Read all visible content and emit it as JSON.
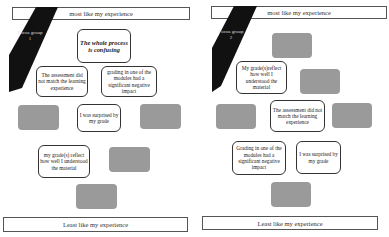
{
  "panels": [
    {
      "focus_label": "Focus group 1",
      "top_label": "most like my experience",
      "bottom_label": "Least like my experience",
      "cards": [
        {
          "text": "The whole process is confusing",
          "emphasis": true
        },
        {
          "text": "The assessment did not match the learning experience"
        },
        {
          "text": "grading in one of the modules had a significant negative impact"
        },
        {
          "text": "I was surprised by my grade"
        },
        {
          "text": "my grade(s) reflect how well I understood the material"
        }
      ]
    },
    {
      "focus_label": "Focus group 2",
      "top_label": "most like my experience",
      "bottom_label": "Least like my experience",
      "cards": [
        {
          "text": "My grade(s)reflect how well I understood the material"
        },
        {
          "text": "The assessment did not match the learning experience"
        },
        {
          "text": "Grading in one of the modules had a significant negative impact"
        },
        {
          "text": "I was surprised by my grade"
        }
      ]
    }
  ],
  "colors": {
    "empty_slot": "#9a9a9a",
    "stripe": "#111111"
  }
}
